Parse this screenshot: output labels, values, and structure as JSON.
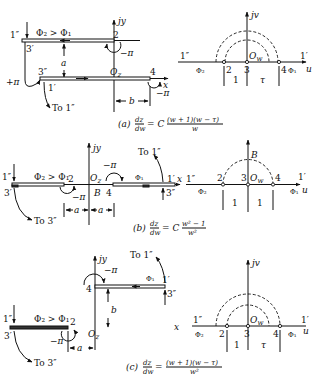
{
  "figures": [
    {
      "id": "a",
      "caption_label": "(a)",
      "caption_lhs_num": "dz",
      "caption_lhs_den": "dw",
      "caption_eq": "= C",
      "caption_rhs_num": "(w + 1)(w − τ)",
      "caption_rhs_den": "w",
      "z_plane": {
        "axis_x": "x",
        "axis_y": "jy",
        "origin": "O",
        "origin_sub": "z",
        "flux_label": "Φ₂ > Φ₁",
        "points": [
          "1″",
          "3′",
          "2",
          "3″",
          "1′",
          "4"
        ],
        "angles": [
          "−π",
          "+π",
          "−π"
        ],
        "dims": [
          "a",
          "b"
        ],
        "note": "To 1″"
      },
      "w_plane": {
        "axis_u": "u",
        "axis_v": "jv",
        "origin": "O",
        "origin_sub": "w",
        "left_end": "1″",
        "right_end": "1′",
        "left_flux": "Φ₂",
        "right_flux": "Φ₁",
        "points": [
          "2",
          "3",
          "4"
        ],
        "dims": [
          "1",
          "τ"
        ]
      }
    },
    {
      "id": "b",
      "caption_label": "(b)",
      "caption_lhs_num": "dz",
      "caption_lhs_den": "dw",
      "caption_eq": "= C",
      "caption_rhs_num": "w² − 1",
      "caption_rhs_den": "w²",
      "z_plane": {
        "axis_x": "x",
        "axis_y": "jy",
        "origin": "O",
        "origin_sub": "z",
        "flux_label": "Φ₂ > Φ₁",
        "flux_right": "Φ₁",
        "points": [
          "1″",
          "3′",
          "2",
          "B",
          "4",
          "1′",
          "3″"
        ],
        "angles": [
          "−π",
          "−π"
        ],
        "dims": [
          "a",
          "a"
        ],
        "notes": [
          "To 3″",
          "To 1″"
        ]
      },
      "w_plane": {
        "axis_u": "u",
        "axis_v": "jv",
        "origin": "O",
        "origin_sub": "w",
        "left_end": "1″",
        "right_end": "1′",
        "left_flux": "Φ₂",
        "right_flux": "Φ₁",
        "points": [
          "2",
          "3",
          "4"
        ],
        "top_point": "B",
        "dims": [
          "1",
          "1"
        ]
      }
    },
    {
      "id": "c",
      "caption_label": "(c)",
      "caption_lhs_num": "dz",
      "caption_lhs_den": "dw",
      "caption_eq": "=",
      "caption_rhs_num": "(w + 1)(w − τ)",
      "caption_rhs_den": "w²",
      "z_plane": {
        "axis_x": "x",
        "axis_y": "jy",
        "origin": "O",
        "origin_sub": "z",
        "flux_label": "Φ₂ > Φ₁",
        "flux_right": "Φ₁",
        "points": [
          "4",
          "1′",
          "3″",
          "1″",
          "3′",
          "2"
        ],
        "angles": [
          "−π",
          "−π"
        ],
        "dims": [
          "a",
          "b"
        ],
        "notes": [
          "To 1″",
          "To 3″"
        ]
      },
      "w_plane": {
        "axis_u": "u",
        "axis_v": "jv",
        "origin": "O",
        "origin_sub": "w",
        "left_end": "1″",
        "right_end": "1′",
        "left_flux": "Φ₂",
        "right_flux": "Φ₁",
        "points": [
          "2",
          "3",
          "4"
        ],
        "dims": [
          "1",
          "τ"
        ]
      }
    }
  ]
}
